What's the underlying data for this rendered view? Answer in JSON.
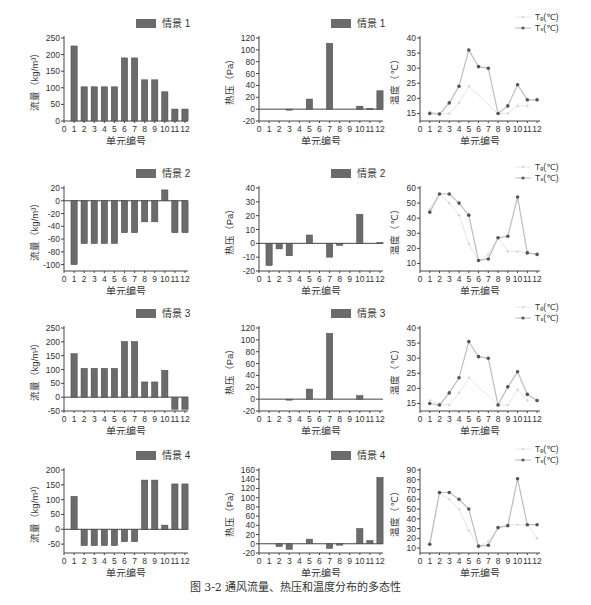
{
  "caption": "图 3-2   通风流量、热压和温度分布的多态性",
  "colors": {
    "bar": "#6b6b6b",
    "axis": "#444444",
    "te_line": "#cfcfcf",
    "ts_line": "#bdbdbd",
    "ts_marker": "#555555",
    "text": "#333333"
  },
  "chart_data": [
    {
      "id": "flow-1",
      "type": "bar",
      "row": 0,
      "col": 0,
      "legend": "情景 1",
      "xlabel": "单元编号",
      "ylabel": "流量（kg/m³）",
      "xticks": [
        "0",
        "1",
        "2",
        "3",
        "4",
        "5",
        "6",
        "7",
        "8",
        "9",
        "10",
        "11",
        "12"
      ],
      "categories": [
        1,
        2,
        3,
        4,
        5,
        6,
        7,
        8,
        9,
        10,
        11,
        12
      ],
      "values": [
        226,
        103,
        103,
        103,
        103,
        190,
        190,
        124,
        124,
        88,
        36,
        36
      ],
      "ylim": [
        0,
        250
      ],
      "yticks": [
        0,
        50,
        100,
        150,
        200,
        250
      ]
    },
    {
      "id": "pressure-1",
      "type": "bar",
      "row": 0,
      "col": 1,
      "legend": "情景 1",
      "xlabel": "单元编号",
      "ylabel": "热压（Pa）",
      "xticks": [
        "0",
        "1",
        "2",
        "3",
        "4",
        "5",
        "6",
        "7",
        "8",
        "9",
        "10",
        "11",
        "12"
      ],
      "categories": [
        1,
        2,
        3,
        4,
        5,
        6,
        7,
        8,
        9,
        10,
        11,
        12
      ],
      "values": [
        0,
        0,
        -1,
        0,
        17,
        0,
        111,
        0,
        0,
        5,
        1,
        31
      ],
      "ylim": [
        -20,
        120
      ],
      "yticks": [
        -20,
        0,
        20,
        40,
        60,
        80,
        100,
        120
      ]
    },
    {
      "id": "temp-1",
      "type": "line",
      "row": 0,
      "col": 2,
      "xlabel": "单元编号",
      "ylabel": "温度（℃）",
      "xticks": [
        "0",
        "1",
        "2",
        "3",
        "4",
        "5",
        "6",
        "7",
        "8",
        "9",
        "10",
        "11",
        "12"
      ],
      "x": [
        1,
        2,
        3,
        4,
        5,
        6,
        7,
        8,
        9,
        10,
        11,
        12
      ],
      "series": [
        {
          "name": "Tₑ(℃)",
          "values": [
            15.5,
            15,
            15,
            18.5,
            24,
            null,
            null,
            15,
            15,
            17.5,
            17.5,
            null
          ]
        },
        {
          "name": "Tₛ(℃)",
          "values": [
            15,
            14.8,
            18.5,
            24,
            36,
            30.5,
            30,
            15,
            17.5,
            24.5,
            19.5,
            19.5
          ]
        }
      ],
      "ylim": [
        12.5,
        40
      ],
      "yticks": [
        15,
        20,
        25,
        30,
        35,
        40
      ],
      "legend_labels": [
        "Tₑ(℃)",
        "Tₛ(℃)"
      ]
    },
    {
      "id": "flow-2",
      "type": "bar",
      "row": 1,
      "col": 0,
      "legend": "情景 2",
      "xlabel": "单元编号",
      "ylabel": "流量（kg/m³）",
      "xticks": [
        "0",
        "1",
        "2",
        "3",
        "4",
        "5",
        "6",
        "7",
        "8",
        "9",
        "10",
        "11",
        "12"
      ],
      "categories": [
        1,
        2,
        3,
        4,
        5,
        6,
        7,
        8,
        9,
        10,
        11,
        12
      ],
      "values": [
        -100,
        -67,
        -67,
        -67,
        -67,
        -50,
        -50,
        -33,
        -33,
        17,
        -50,
        -50
      ],
      "ylim": [
        -110,
        20
      ],
      "yticks": [
        -100,
        -80,
        -60,
        -40,
        -20,
        0,
        20
      ]
    },
    {
      "id": "pressure-2",
      "type": "bar",
      "row": 1,
      "col": 1,
      "legend": "情景 2",
      "xlabel": "单元编号",
      "ylabel": "热压（Pa）",
      "xticks": [
        "0",
        "1",
        "2",
        "3",
        "4",
        "5",
        "6",
        "7",
        "8",
        "9",
        "10",
        "11",
        "12"
      ],
      "categories": [
        1,
        2,
        3,
        4,
        5,
        6,
        7,
        8,
        9,
        10,
        11,
        12
      ],
      "values": [
        -16,
        -4,
        -9,
        0,
        6,
        0,
        -10,
        -1.5,
        0,
        21,
        0,
        0.5
      ],
      "ylim": [
        -20,
        40
      ],
      "yticks": [
        -20,
        -10,
        0,
        10,
        20,
        30,
        40
      ]
    },
    {
      "id": "temp-2",
      "type": "line",
      "row": 1,
      "col": 2,
      "xlabel": "单元编号",
      "ylabel": "温度（℃）",
      "xticks": [
        "0",
        "1",
        "2",
        "3",
        "4",
        "5",
        "6",
        "7",
        "8",
        "9",
        "10",
        "11",
        "12"
      ],
      "x": [
        1,
        2,
        3,
        4,
        5,
        6,
        7,
        8,
        9,
        10,
        11,
        12
      ],
      "series": [
        {
          "name": "Tₑ(℃)",
          "values": [
            46,
            56,
            50,
            42,
            23,
            12,
            16,
            27,
            18,
            18,
            17,
            16
          ]
        },
        {
          "name": "Tₛ(℃)",
          "values": [
            44,
            56,
            56,
            50,
            42,
            12,
            13,
            27,
            28,
            54,
            17,
            16
          ]
        }
      ],
      "ylim": [
        5,
        60
      ],
      "yticks": [
        10,
        20,
        30,
        40,
        50,
        60
      ],
      "legend_labels": [
        "Tₑ(℃)",
        "Tₛ(℃)"
      ]
    },
    {
      "id": "flow-3",
      "type": "bar",
      "row": 2,
      "col": 0,
      "legend": "情景 3",
      "xlabel": "单元编号",
      "ylabel": "流量（kg/m³）",
      "xticks": [
        "0",
        "1",
        "2",
        "3",
        "4",
        "5",
        "6",
        "7",
        "8",
        "9",
        "10",
        "11",
        "12"
      ],
      "categories": [
        1,
        2,
        3,
        4,
        5,
        6,
        7,
        8,
        9,
        10,
        11,
        12
      ],
      "values": [
        157,
        104,
        104,
        104,
        104,
        201,
        201,
        55,
        55,
        97,
        -44,
        -44
      ],
      "ylim": [
        -50,
        250
      ],
      "yticks": [
        -50,
        0,
        50,
        100,
        150,
        200,
        250
      ]
    },
    {
      "id": "pressure-3",
      "type": "bar",
      "row": 2,
      "col": 1,
      "legend": "情景 3",
      "xlabel": "单元编号",
      "ylabel": "热压（Pa）",
      "xticks": [
        "0",
        "1",
        "2",
        "3",
        "4",
        "5",
        "6",
        "7",
        "8",
        "9",
        "10",
        "11",
        "12"
      ],
      "categories": [
        1,
        2,
        3,
        4,
        5,
        6,
        7,
        8,
        9,
        10,
        11,
        12
      ],
      "values": [
        0,
        0,
        -1,
        0,
        17,
        0,
        111,
        0,
        0,
        6,
        0,
        0
      ],
      "ylim": [
        -20,
        120
      ],
      "yticks": [
        -20,
        0,
        20,
        40,
        60,
        80,
        100,
        120
      ]
    },
    {
      "id": "temp-3",
      "type": "line",
      "row": 2,
      "col": 2,
      "xlabel": "单元编号",
      "ylabel": "温度（℃）",
      "xticks": [
        "0",
        "1",
        "2",
        "3",
        "4",
        "5",
        "6",
        "7",
        "8",
        "9",
        "10",
        "11",
        "12"
      ],
      "x": [
        1,
        2,
        3,
        4,
        5,
        6,
        7,
        8,
        9,
        10,
        11,
        12
      ],
      "series": [
        {
          "name": "Tₑ(℃)",
          "values": [
            16,
            15,
            14.5,
            18.5,
            23.5,
            null,
            null,
            14.5,
            14.5,
            19.5,
            16,
            null
          ]
        },
        {
          "name": "Tₛ(℃)",
          "values": [
            15,
            14.5,
            18.5,
            23.5,
            35.5,
            30.5,
            30,
            14.5,
            20.5,
            25.5,
            18,
            16
          ]
        }
      ],
      "ylim": [
        12.5,
        40
      ],
      "yticks": [
        15,
        20,
        25,
        30,
        35,
        40
      ],
      "legend_labels": [
        "Tₑ(℃)",
        "Tₛ(℃)"
      ]
    },
    {
      "id": "flow-4",
      "type": "bar",
      "row": 3,
      "col": 0,
      "legend": "情景 4",
      "xlabel": "单元编号",
      "ylabel": "流量（kg/m³）",
      "xticks": [
        "0",
        "1",
        "2",
        "3",
        "4",
        "5",
        "6",
        "7",
        "8",
        "9",
        "10",
        "11",
        "12"
      ],
      "categories": [
        1,
        2,
        3,
        4,
        5,
        6,
        7,
        8,
        9,
        10,
        11,
        12
      ],
      "values": [
        111,
        -55,
        -55,
        -55,
        -55,
        -42,
        -42,
        166,
        166,
        14,
        153,
        153
      ],
      "ylim": [
        -80,
        200
      ],
      "yticks": [
        -50,
        0,
        50,
        100,
        150,
        200
      ]
    },
    {
      "id": "pressure-4",
      "type": "bar",
      "row": 3,
      "col": 1,
      "legend": "情景 4",
      "xlabel": "单元编号",
      "ylabel": "热压（Pa）",
      "xticks": [
        "0",
        "1",
        "2",
        "3",
        "4",
        "5",
        "6",
        "7",
        "8",
        "9",
        "10",
        "11",
        "12"
      ],
      "categories": [
        1,
        2,
        3,
        4,
        5,
        6,
        7,
        8,
        9,
        10,
        11,
        12
      ],
      "values": [
        0,
        -6,
        -12,
        0,
        10,
        0,
        -10,
        -3,
        0,
        33,
        7,
        144
      ],
      "ylim": [
        -20,
        160
      ],
      "yticks": [
        -20,
        0,
        20,
        40,
        60,
        80,
        100,
        120,
        140,
        160
      ]
    },
    {
      "id": "temp-4",
      "type": "line",
      "row": 3,
      "col": 2,
      "xlabel": "单元编号",
      "ylabel": "温度（℃）",
      "xticks": [
        "0",
        "1",
        "2",
        "3",
        "4",
        "5",
        "6",
        "7",
        "8",
        "9",
        "10",
        "11",
        "12"
      ],
      "x": [
        1,
        2,
        3,
        4,
        5,
        6,
        7,
        8,
        9,
        10,
        11,
        12
      ],
      "series": [
        {
          "name": "Tₑ(℃)",
          "values": [
            16,
            66,
            60,
            50,
            28,
            12,
            17,
            30,
            34,
            34,
            34,
            20
          ]
        },
        {
          "name": "Tₛ(℃)",
          "values": [
            14,
            67,
            67,
            60,
            50,
            12,
            13,
            31,
            33,
            81,
            34,
            34
          ]
        }
      ],
      "ylim": [
        5,
        90
      ],
      "yticks": [
        10,
        20,
        30,
        40,
        50,
        60,
        70,
        80,
        90
      ],
      "legend_labels": [
        "Tₑ(℃)",
        "Tₛ(℃)"
      ]
    }
  ]
}
